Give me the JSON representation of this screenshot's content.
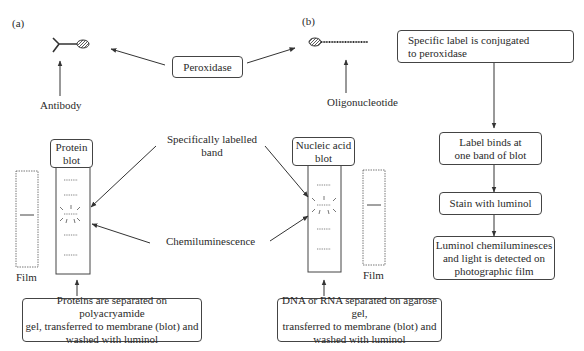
{
  "panel_labels": {
    "a": "(a)",
    "b": "(b)"
  },
  "top": {
    "peroxidase": "Peroxidase",
    "antibody": "Antibody",
    "oligonucleotide": "Oligonucleotide"
  },
  "middle": {
    "specifically_labelled_band": "Specifically labelled band",
    "specifically_labelled_band_line1": "Specifically labelled",
    "specifically_labelled_band_line2": "band",
    "chemiluminescence": "Chemiluminescence"
  },
  "protein_blot": {
    "title_line1": "Protein",
    "title_line2": "blot",
    "film_label": "Film",
    "caption_line1": "Proteins are separated on polyacryamide",
    "caption_line2": "gel, transferred to membrane (blot) and",
    "caption_line3": "washed with luminol"
  },
  "nucleic_blot": {
    "title_line1": "Nucleic acid",
    "title_line2": "blot",
    "film_label": "Film",
    "caption_line1": "DNA or RNA separated on agarose gel,",
    "caption_line2": "transferred to membrane (blot) and",
    "caption_line3": "washed with luminol"
  },
  "flowchart": {
    "steps": [
      {
        "line1": "Specific label is conjugated",
        "line2": "to peroxidase"
      },
      {
        "line1": "Label binds at",
        "line2": "one band of blot"
      },
      {
        "line1": "Stain with luminol"
      },
      {
        "line1": "Luminol chemiluminesces",
        "line2": "and light is detected on",
        "line3": "photographic film"
      }
    ]
  },
  "colors": {
    "line": "#444444",
    "text": "#2a2a2a",
    "background": "#ffffff"
  }
}
